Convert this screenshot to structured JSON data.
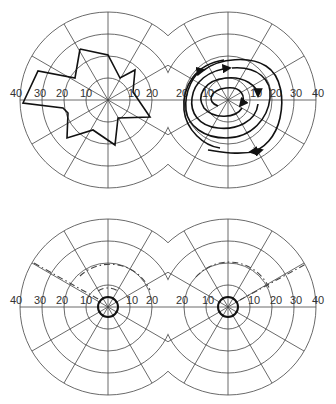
{
  "figure": {
    "scale_unit_px_per_10deg": 22,
    "ring_values": [
      10,
      20,
      30,
      40
    ],
    "meridian_count": 12
  },
  "panels": [
    {
      "id": "top-left",
      "center": [
        108,
        100
      ],
      "axis_labels_left": [
        "40",
        "30",
        "20",
        "10"
      ],
      "axis_labels_right": [
        "10",
        "20"
      ],
      "content": "irregular star-shaped field boundary polygon"
    },
    {
      "id": "top-right",
      "center": [
        228,
        100
      ],
      "axis_labels_left": [
        "20",
        "10"
      ],
      "axis_labels_right": [
        "10",
        "20",
        "30",
        "40"
      ],
      "content": "spiral trajectory with arrowheads"
    },
    {
      "id": "bottom-left",
      "center": [
        108,
        307
      ],
      "axis_labels_left": [
        "40",
        "30",
        "20",
        "10"
      ],
      "axis_labels_right": [
        "10",
        "20"
      ],
      "content": "small central bold ring with dashed arcs"
    },
    {
      "id": "bottom-right",
      "center": [
        228,
        307
      ],
      "axis_labels_left": [
        "20",
        "10"
      ],
      "axis_labels_right": [
        "10",
        "20",
        "30",
        "40"
      ],
      "content": "small central bold ring with dashed arcs"
    }
  ]
}
